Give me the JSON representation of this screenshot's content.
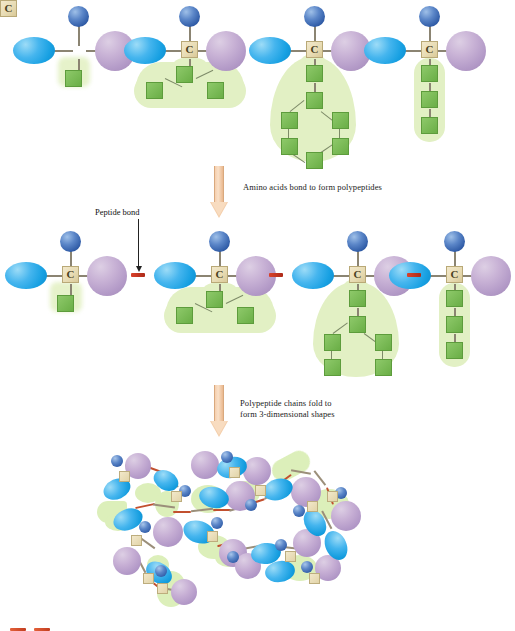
{
  "figure": {
    "type": "biology-diagram",
    "carbon_label": "C"
  },
  "rows": {
    "row1_label": "Individual amino acids",
    "row2_label": "Polypeptide chain",
    "row3_label": "Folded protein"
  },
  "amino_acids": [
    {
      "index": 1,
      "carbon": "C",
      "amino_group": "amino-group",
      "carboxyl_group": "carboxyl-group",
      "hydrogen_group": "hydrogen-group",
      "side_chain": "single-unit",
      "side_chain_units": 1
    },
    {
      "index": 2,
      "carbon": "C",
      "amino_group": "amino-group",
      "carboxyl_group": "carboxyl-group",
      "hydrogen_group": "hydrogen-group",
      "side_chain": "branched",
      "side_chain_units": 3
    },
    {
      "index": 3,
      "carbon": "C",
      "amino_group": "amino-group",
      "carboxyl_group": "carboxyl-group",
      "hydrogen_group": "hydrogen-group",
      "side_chain": "ring",
      "side_chain_units": 8
    },
    {
      "index": 4,
      "carbon": "C",
      "amino_group": "amino-group",
      "carboxyl_group": "carboxyl-group",
      "hydrogen_group": "hydrogen-group",
      "side_chain": "linear",
      "side_chain_units": 3
    }
  ],
  "annotations": {
    "step1_caption": "Amino acids bond to form polypeptides",
    "step2_caption": "Polypeptide chains fold to\nform 3-dimensional shapes",
    "peptide_bond_label": "Peptide bond"
  },
  "colors": {
    "amino_group": "#2f5ba6",
    "carboxyl_group": "#b49bc8",
    "hydrogen_group": "#17a0e2",
    "carbon_square": "#e8dcb4",
    "side_chain_square": "#6aae46",
    "side_chain_halo": "#e2f0c4",
    "peptide_bond": "#c2331c",
    "arrow": "#f3ceab",
    "background": "#ffffff",
    "text": "#1b1b1b"
  }
}
